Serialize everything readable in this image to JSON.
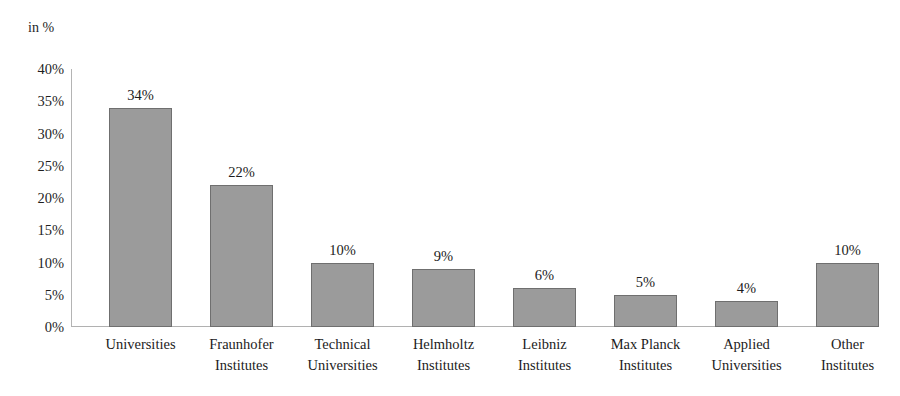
{
  "chart_data": {
    "type": "bar",
    "title": "",
    "subtitle": "",
    "xlabel": "",
    "ylabel": "in %",
    "ylim": [
      0,
      40
    ],
    "ytick_step": 5,
    "ytick_labels": [
      "40%",
      "35%",
      "30%",
      "25%",
      "20%",
      "15%",
      "10%",
      "5%",
      "0%"
    ],
    "grid": false,
    "legend": false,
    "categories": [
      "Universities",
      "Fraunhofer Institutes",
      "Technical Universities",
      "Helmholtz Institutes",
      "Leibniz Institutes",
      "Max Planck Institutes",
      "Applied Universities",
      "Other Institutes"
    ],
    "category_lines": [
      [
        "Universities"
      ],
      [
        "Fraunhofer",
        "Institutes"
      ],
      [
        "Technical",
        "Universities"
      ],
      [
        "Helmholtz",
        "Institutes"
      ],
      [
        "Leibniz",
        "Institutes"
      ],
      [
        "Max Planck",
        "Institutes"
      ],
      [
        "Applied",
        "Universities"
      ],
      [
        "Other",
        "Institutes"
      ]
    ],
    "values": [
      34,
      22,
      10,
      9,
      6,
      5,
      4,
      10
    ],
    "value_labels": [
      "34%",
      "22%",
      "10%",
      "9%",
      "6%",
      "5%",
      "4%",
      "10%"
    ],
    "colors": {
      "bar_fill": "#9b9b9b",
      "bar_border": "#6f6f6f",
      "axis_line": "#b4b4b4",
      "text": "#1c1c1c",
      "background": "#ffffff"
    }
  }
}
